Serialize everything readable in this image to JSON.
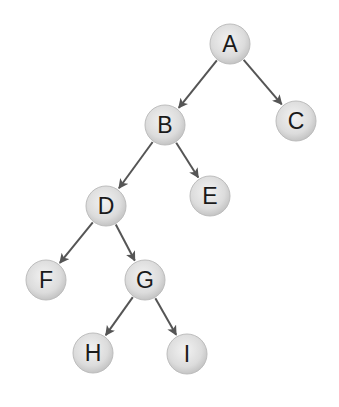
{
  "diagram": {
    "type": "binary-tree",
    "colors": {
      "node_fill_light": "#f0f0f0",
      "node_fill_dark": "#c8c8c8",
      "node_stroke": "#bdbdbd",
      "edge": "#555555",
      "text": "#1a1a1a"
    },
    "node_radius": 20,
    "nodes": [
      {
        "id": "A",
        "label": "A",
        "x": 230,
        "y": 44
      },
      {
        "id": "B",
        "label": "B",
        "x": 165,
        "y": 125
      },
      {
        "id": "C",
        "label": "C",
        "x": 296,
        "y": 121
      },
      {
        "id": "D",
        "label": "D",
        "x": 106,
        "y": 206
      },
      {
        "id": "E",
        "label": "E",
        "x": 210,
        "y": 196
      },
      {
        "id": "F",
        "label": "F",
        "x": 46,
        "y": 280
      },
      {
        "id": "G",
        "label": "G",
        "x": 145,
        "y": 280
      },
      {
        "id": "H",
        "label": "H",
        "x": 93,
        "y": 353
      },
      {
        "id": "I",
        "label": "I",
        "x": 187,
        "y": 354
      }
    ],
    "edges": [
      {
        "from": "A",
        "to": "B"
      },
      {
        "from": "A",
        "to": "C"
      },
      {
        "from": "B",
        "to": "D"
      },
      {
        "from": "B",
        "to": "E"
      },
      {
        "from": "D",
        "to": "F"
      },
      {
        "from": "D",
        "to": "G"
      },
      {
        "from": "G",
        "to": "H"
      },
      {
        "from": "G",
        "to": "I"
      }
    ]
  }
}
